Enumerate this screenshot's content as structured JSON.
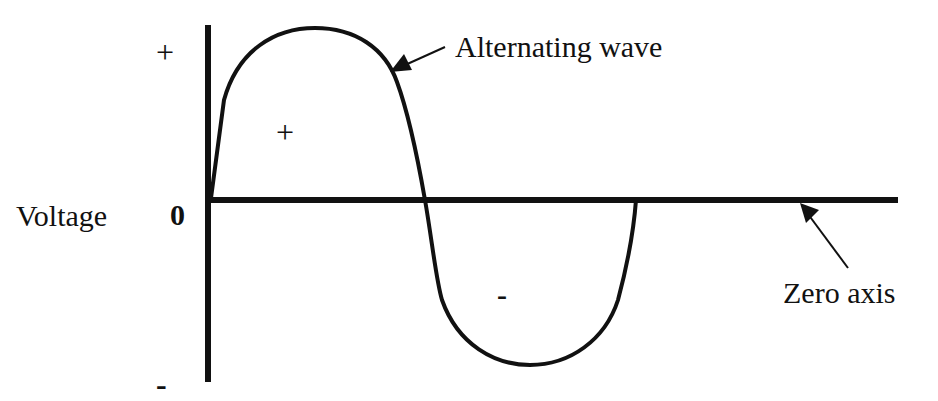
{
  "diagram": {
    "type": "alternating-wave",
    "labels": {
      "plus_top": "+",
      "minus_bottom": "-",
      "zero": "0",
      "voltage": "Voltage",
      "positive_region": "+",
      "negative_region": "-",
      "alternating_wave": "Alternating wave",
      "zero_axis": "Zero axis"
    },
    "colors": {
      "ink": "#111111",
      "background": "#ffffff"
    }
  }
}
